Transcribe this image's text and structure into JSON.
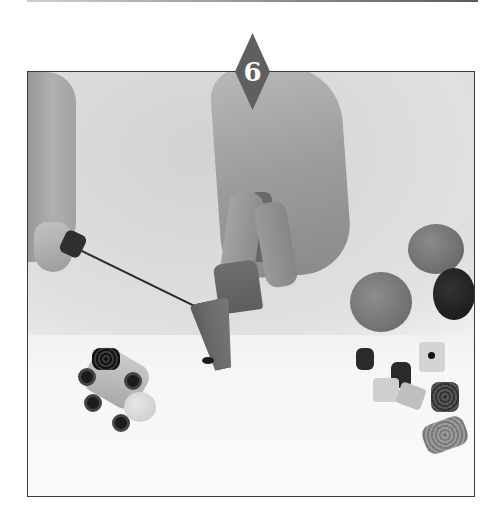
{
  "step": {
    "number": "6",
    "badge_color": "#5f5f5f"
  },
  "photo": {
    "description": "Grayscale instructional photo: hands using a knife to cut a cone-shaped piece of modelling clay, with clay balls, liquorice candies, a gummy bear and a finished clay racing-car figure on the table",
    "objects": [
      "left-hand-holding-knife",
      "right-hand-holding-clay",
      "clay-cone",
      "clay-ball-medium",
      "clay-ball-large",
      "clay-ball-dark",
      "liquorice-candies",
      "gummy-bear",
      "clay-racing-car-figure"
    ]
  }
}
